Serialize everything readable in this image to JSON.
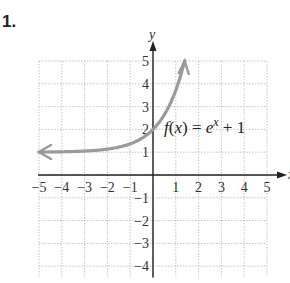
{
  "problem": {
    "number": "1."
  },
  "chart_data": {
    "type": "line",
    "title": "",
    "function_label": "f(x) = e^x + 1",
    "function_label_parts": {
      "f": "f",
      "open": "(",
      "var": "x",
      "close": ")",
      "eq": " = ",
      "base": "e",
      "exp": "x",
      "rest": " + 1"
    },
    "xlabel": "x",
    "ylabel": "y",
    "xlim": [
      -5,
      5
    ],
    "ylim": [
      -4.5,
      5
    ],
    "grid": true,
    "x_ticks": [
      -5,
      -4,
      -3,
      -2,
      -1,
      1,
      2,
      3,
      4,
      5
    ],
    "y_ticks": [
      -4,
      -3,
      -2,
      -1,
      1,
      2,
      3,
      4,
      5
    ],
    "x_tick_labels": [
      "−5",
      "−4",
      "−3",
      "−2",
      "−1",
      "1",
      "2",
      "3",
      "4",
      "5"
    ],
    "y_tick_labels": [
      "−4",
      "−3",
      "−2",
      "−1",
      "1",
      "2",
      "3",
      "4",
      "5"
    ],
    "series": [
      {
        "name": "f(x) = e^x + 1",
        "color": "#9a9a9a",
        "arrows": "both",
        "x": [
          -5,
          -4,
          -3,
          -2,
          -1,
          0,
          0.5,
          1,
          1.39
        ],
        "y": [
          1.01,
          1.02,
          1.05,
          1.14,
          1.37,
          2,
          2.65,
          3.72,
          5.0
        ]
      }
    ]
  }
}
